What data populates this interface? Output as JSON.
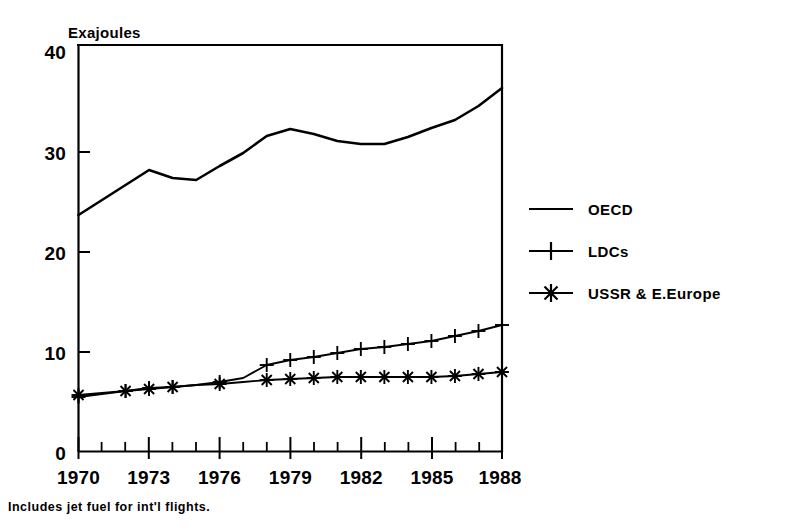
{
  "chart_data": {
    "type": "line",
    "title": "",
    "ylabel": "Exajoules",
    "xlabel": "",
    "ylim": [
      0,
      40
    ],
    "xlim": [
      1970,
      1988
    ],
    "yticks": [
      "0",
      "10",
      "20",
      "30",
      "40"
    ],
    "ytick_values": [
      0,
      10,
      20,
      30,
      40
    ],
    "xticks": [
      "1970",
      "1973",
      "1976",
      "1979",
      "1982",
      "1985",
      "1988"
    ],
    "xtick_values": [
      1970,
      1973,
      1976,
      1979,
      1982,
      1985,
      1988
    ],
    "x_minor_tick_step": 1,
    "grid": false,
    "legend_position": "right",
    "x": [
      1970,
      1971,
      1972,
      1973,
      1974,
      1975,
      1976,
      1977,
      1978,
      1979,
      1980,
      1981,
      1982,
      1983,
      1984,
      1985,
      1986,
      1987,
      1988
    ],
    "series": [
      {
        "name": "OECD",
        "marker": "none",
        "values": [
          23.7,
          25.2,
          26.7,
          28.2,
          27.4,
          27.2,
          28.6,
          29.9,
          31.6,
          32.3,
          31.8,
          31.1,
          30.8,
          30.8,
          31.5,
          32.4,
          33.2,
          34.6,
          36.4
        ]
      },
      {
        "name": "LDCs",
        "marker": "plus",
        "values": [
          5.5,
          5.8,
          6.1,
          6.4,
          6.5,
          6.7,
          7.0,
          7.4,
          8.7,
          9.2,
          9.5,
          9.9,
          10.3,
          10.5,
          10.8,
          11.1,
          11.6,
          12.1,
          12.7
        ]
      },
      {
        "name": "USSR & E.Europe",
        "marker": "asterisk",
        "values": [
          5.7,
          5.9,
          6.1,
          6.3,
          6.5,
          6.7,
          6.8,
          7.0,
          7.2,
          7.3,
          7.4,
          7.5,
          7.5,
          7.5,
          7.5,
          7.5,
          7.6,
          7.8,
          8.0
        ]
      }
    ],
    "footnote": "Includes jet fuel for int'l flights."
  },
  "legend": {
    "items": [
      {
        "label": "OECD",
        "marker": "line"
      },
      {
        "label": "LDCs",
        "marker": "plus"
      },
      {
        "label": "USSR & E.Europe",
        "marker": "asterisk"
      }
    ]
  },
  "colors": {
    "line": "#000000",
    "axis": "#000000",
    "background": "#ffffff"
  }
}
